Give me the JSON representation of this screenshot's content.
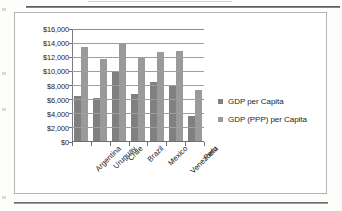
{
  "document": {
    "rules": {
      "top_rule": "horizontal-rule",
      "bottom_rule": "horizontal-rule"
    }
  },
  "chart_data": {
    "type": "bar",
    "title": "",
    "subtitle": "",
    "xlabel": "",
    "ylabel": "",
    "categories": [
      "Argentina",
      "Uruguay",
      "Chile",
      "Brazil",
      "Mexico",
      "Venezuela",
      "Peru"
    ],
    "series": [
      {
        "name": "GDP per Capita",
        "color": "#808080",
        "values": [
          6500,
          6100,
          9900,
          6700,
          8400,
          8000,
          3600
        ]
      },
      {
        "name": "GDP (PPP) per Capita",
        "color": "#9a9a9a",
        "values": [
          13400,
          11700,
          14000,
          11950,
          12700,
          12800,
          7300
        ]
      }
    ],
    "ylim": [
      0,
      16000
    ],
    "ytick_step": 2000,
    "ytick_labels": [
      "$0",
      "$2,000",
      "$4,000",
      "$6,000",
      "$8,000",
      "$10,000",
      "$12,000",
      "$14,000",
      "$16,000"
    ],
    "ytick_values": [
      0,
      2000,
      4000,
      6000,
      8000,
      10000,
      12000,
      14000,
      16000
    ],
    "grid": true,
    "grid_axis": "y",
    "legend_position": "right",
    "legend": [
      "GDP per Capita",
      "GDP (PPP) per Capita"
    ]
  }
}
